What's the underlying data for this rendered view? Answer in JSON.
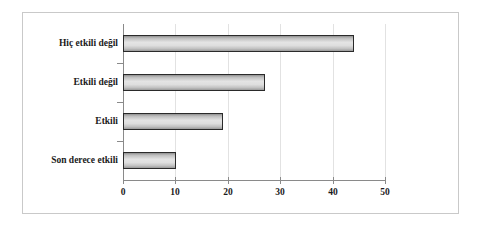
{
  "chart_data": {
    "type": "bar",
    "orientation": "horizontal",
    "title": "",
    "xlabel": "",
    "ylabel": "",
    "categories": [
      "Son derece etkili",
      "Etkili",
      "Etkili değil",
      "Hiç etkili değil"
    ],
    "values": [
      10,
      19,
      27,
      44
    ],
    "xlim": [
      0,
      50
    ],
    "xticks": [
      0,
      10,
      20,
      30,
      40,
      50
    ],
    "xtick_labels": [
      "0",
      "10",
      "20",
      "30",
      "40",
      "50"
    ],
    "grid": "vertical-only",
    "legend": "none",
    "bar_fill": "#dedede",
    "bar_border": "#2a2a2a",
    "axis_color": "#8a8a8a",
    "frame_color": "#c9c9c9",
    "bars": [
      {
        "category": "Hiç etkili değil",
        "value": 44
      },
      {
        "category": "Etkili değil",
        "value": 27
      },
      {
        "category": "Etkili",
        "value": 19
      },
      {
        "category": "Son derece etkili",
        "value": 10
      }
    ]
  }
}
